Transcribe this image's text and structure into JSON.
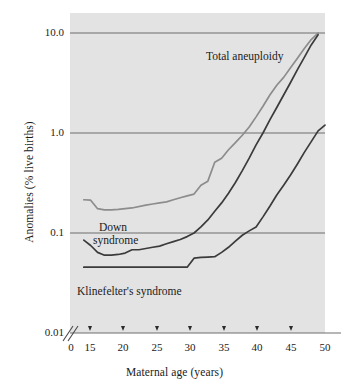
{
  "figure": {
    "background_color": "#ffffff",
    "plot_background_color": "#e3e3e3",
    "axis_color": "#7d7d7d",
    "gridline_color": "#6f6f6f"
  },
  "axes": {
    "x_title": "Maternal age (years)",
    "y_title": "Anomalies (% live births)",
    "x_ticks": [
      "0",
      "15",
      "20",
      "25",
      "30",
      "35",
      "40",
      "45",
      "50"
    ],
    "y_ticks": [
      "10.0",
      "1.0",
      "0.1",
      "0.01"
    ],
    "axis_break": "//"
  },
  "series_labels": {
    "total_aneuploidy": "Total aneuploidy",
    "down_line1": "Down",
    "down_line2": "syndrome",
    "klinefelter": "Klinefelter's syndrome"
  },
  "chart_data": {
    "type": "line",
    "title": "",
    "xlabel": "Maternal age (years)",
    "ylabel": "Anomalies (% live births)",
    "xlim": [
      13,
      50
    ],
    "ylim": [
      0.01,
      10.0
    ],
    "yscale": "log",
    "grid": true,
    "gridlines_y": [
      10.0,
      1.0,
      0.1
    ],
    "legend": "inline-annotations",
    "xticks": [
      0,
      15,
      20,
      25,
      30,
      35,
      40,
      45,
      50
    ],
    "yticks": [
      0.01,
      0.1,
      1.0,
      10.0
    ],
    "series": [
      {
        "name": "Total aneuploidy",
        "color": "#8c8c8c",
        "x": [
          15,
          16,
          17,
          18,
          19,
          20,
          22,
          24,
          25,
          26,
          27,
          28,
          29,
          30,
          31,
          32,
          33,
          34,
          35,
          36,
          37,
          38,
          39,
          40,
          41,
          42,
          43,
          44,
          45,
          46,
          47,
          48,
          49
        ],
        "y": [
          0.215,
          0.213,
          0.175,
          0.17,
          0.17,
          0.172,
          0.178,
          0.19,
          0.195,
          0.2,
          0.205,
          0.215,
          0.225,
          0.235,
          0.245,
          0.3,
          0.33,
          0.51,
          0.56,
          0.68,
          0.8,
          0.95,
          1.15,
          1.45,
          1.85,
          2.4,
          3.0,
          3.6,
          4.5,
          5.6,
          7.0,
          8.6,
          10.0
        ]
      },
      {
        "name": "Down syndrome",
        "color": "#3b3b3b",
        "x": [
          15,
          16,
          17,
          18,
          19,
          20,
          21,
          22,
          23,
          24,
          25,
          26,
          27,
          28,
          29,
          30,
          31,
          32,
          33,
          34,
          35,
          36,
          37,
          38,
          39,
          40,
          41,
          42,
          43,
          44,
          45,
          46,
          47,
          48,
          49
        ],
        "y": [
          0.085,
          0.075,
          0.064,
          0.06,
          0.06,
          0.061,
          0.063,
          0.068,
          0.068,
          0.07,
          0.072,
          0.074,
          0.078,
          0.082,
          0.086,
          0.092,
          0.1,
          0.115,
          0.135,
          0.165,
          0.2,
          0.25,
          0.32,
          0.42,
          0.56,
          0.76,
          1.0,
          1.35,
          1.8,
          2.4,
          3.2,
          4.3,
          5.7,
          7.6,
          9.6
        ]
      },
      {
        "name": "Klinefelter's syndrome",
        "color": "#3b3b3b",
        "x": [
          15,
          20,
          25,
          28,
          30,
          31,
          32,
          33,
          34,
          35,
          36,
          37,
          38,
          39,
          40,
          41,
          42,
          43,
          44,
          45,
          46,
          47,
          48,
          49,
          50
        ],
        "y": [
          0.0455,
          0.0455,
          0.0455,
          0.0455,
          0.0455,
          0.056,
          0.057,
          0.0575,
          0.058,
          0.064,
          0.072,
          0.083,
          0.095,
          0.105,
          0.115,
          0.145,
          0.185,
          0.24,
          0.3,
          0.38,
          0.49,
          0.64,
          0.82,
          1.05,
          1.2
        ]
      }
    ]
  }
}
